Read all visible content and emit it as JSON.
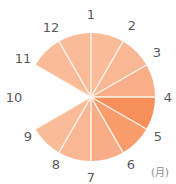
{
  "chart_data": {
    "type": "pie",
    "subtype": "clock-style polar wedge chart (months as spokes)",
    "title": "",
    "unit_label": "(月)",
    "center": [
      91,
      97
    ],
    "radius": 64,
    "spokes": [
      {
        "label": "1",
        "angle": 0
      },
      {
        "label": "2",
        "angle": 30
      },
      {
        "label": "3",
        "angle": 60
      },
      {
        "label": "4",
        "angle": 90
      },
      {
        "label": "5",
        "angle": 120
      },
      {
        "label": "6",
        "angle": 150
      },
      {
        "label": "7",
        "angle": 180
      },
      {
        "label": "8",
        "angle": 210
      },
      {
        "label": "9",
        "angle": 240
      },
      {
        "label": "10",
        "angle": 270
      },
      {
        "label": "11",
        "angle": 300
      },
      {
        "label": "12",
        "angle": 330
      }
    ],
    "segments": [
      {
        "from": "11",
        "to": "12",
        "start": 300,
        "end": 330,
        "color": "#F9BB98"
      },
      {
        "from": "12",
        "to": "1",
        "start": 330,
        "end": 360,
        "color": "#F9BB98"
      },
      {
        "from": "1",
        "to": "2",
        "start": 0,
        "end": 30,
        "color": "#F9BB98"
      },
      {
        "from": "2",
        "to": "3",
        "start": 30,
        "end": 60,
        "color": "#F9B793"
      },
      {
        "from": "3",
        "to": "4",
        "start": 60,
        "end": 90,
        "color": "#F9AE89"
      },
      {
        "from": "4",
        "to": "5",
        "start": 90,
        "end": 120,
        "color": "#F98F5B"
      },
      {
        "from": "5",
        "to": "6",
        "start": 120,
        "end": 150,
        "color": "#F99C6C"
      },
      {
        "from": "6",
        "to": "7",
        "start": 150,
        "end": 180,
        "color": "#F9AC88"
      },
      {
        "from": "7",
        "to": "8",
        "start": 180,
        "end": 210,
        "color": "#F9B793"
      },
      {
        "from": "8",
        "to": "9",
        "start": 210,
        "end": 240,
        "color": "#F9BB98"
      }
    ],
    "empty_range": {
      "from": "9",
      "to": "11",
      "note": "no wedge around month 10"
    },
    "label_positions": {
      "1": [
        91,
        14
      ],
      "2": [
        132,
        25
      ],
      "3": [
        157,
        52
      ],
      "4": [
        168,
        97
      ],
      "5": [
        158,
        136
      ],
      "6": [
        131,
        164
      ],
      "7": [
        91,
        177
      ],
      "8": [
        56,
        164
      ],
      "9": [
        28,
        136
      ],
      "10": [
        14,
        97
      ],
      "11": [
        23,
        58
      ],
      "12": [
        51,
        27
      ]
    },
    "separator_color": "#FFF6EC",
    "label_color": "#5A5A5A"
  }
}
